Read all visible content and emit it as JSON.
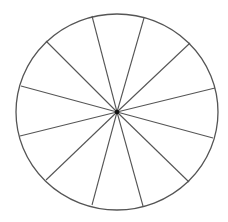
{
  "diagram": {
    "type": "circle-divided-into-sectors",
    "sector_count": 12,
    "background": "#ffffff",
    "stroke_color": "#555555",
    "center_color": "#111111",
    "center": {
      "x": 117,
      "y": 112
    },
    "radius": {
      "rx": 101,
      "ry": 98
    },
    "spoke_endpoints": [
      {
        "x": 92,
        "y": 16
      },
      {
        "x": 144,
        "y": 18
      },
      {
        "x": 190,
        "y": 43
      },
      {
        "x": 215,
        "y": 88
      },
      {
        "x": 213,
        "y": 138
      },
      {
        "x": 189,
        "y": 182
      },
      {
        "x": 143,
        "y": 206
      },
      {
        "x": 92,
        "y": 205
      },
      {
        "x": 46,
        "y": 180
      },
      {
        "x": 20,
        "y": 136
      },
      {
        "x": 21,
        "y": 86
      },
      {
        "x": 46,
        "y": 41
      }
    ]
  }
}
